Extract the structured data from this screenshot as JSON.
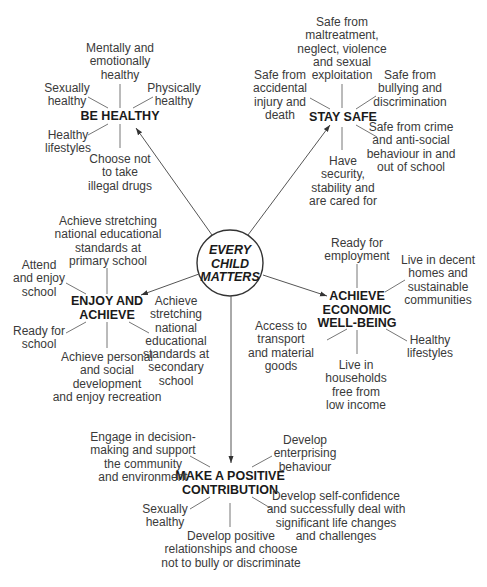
{
  "center": {
    "label": "EVERY\nCHILD\nMATTERS"
  },
  "outcomes": {
    "be_healthy": {
      "title": "BE HEALTHY",
      "items": [
        "Mentally and\nemotionally\nhealthy",
        "Physically\nhealthy",
        "Choose not\nto take\nillegal drugs",
        "Healthy\nlifestyles",
        "Sexually\nhealthy"
      ]
    },
    "stay_safe": {
      "title": "STAY SAFE",
      "items": [
        "Safe from\nmaltreatment,\nneglect, violence\nand sexual\nexploitation",
        "Safe from\nbullying and\ndiscrimination",
        "Safe from crime\nand anti-social\nbehaviour in and\nout of school",
        "Have\nsecurity,\nstability and\nare cared for",
        "Safe from\naccidental\ninjury and\ndeath"
      ]
    },
    "enjoy_achieve": {
      "title": "ENJOY AND\nACHIEVE",
      "items": [
        "Achieve stretching\nnational educational\nstandards at\nprimary school",
        "Achieve\nstretching\nnational\neducational\nstandards at\nsecondary\nschool",
        "Achieve personal\nand social\ndevelopment\nand enjoy recreation",
        "Ready for\nschool",
        "Attend\nand enjoy\nschool"
      ]
    },
    "economic": {
      "title": "ACHIEVE\nECONOMIC\nWELL-BEING",
      "items": [
        "Ready for\nemployment",
        "Live in decent\nhomes and\nsustainable\ncommunities",
        "Healthy\nlifestyles",
        "Live in\nhouseholds\nfree from\nlow income",
        "Access to\ntransport\nand material\ngoods"
      ]
    },
    "positive_contribution": {
      "title": "MAKE A POSITIVE\nCONTRIBUTION",
      "items": [
        "Engage in decision-\nmaking and support\nthe community\nand environment",
        "Develop\nenterprising\nbehaviour",
        "Develop self-confidence\nand successfully deal with\nsignificant life changes\nand challenges",
        "Develop positive\nrelationships and choose\nnot to bully or discriminate",
        "Sexually\nhealthy"
      ]
    }
  },
  "colors": {
    "line": "#555555",
    "text": "#3a3a3a",
    "heading": "#1a1a1a",
    "background": "#ffffff"
  }
}
